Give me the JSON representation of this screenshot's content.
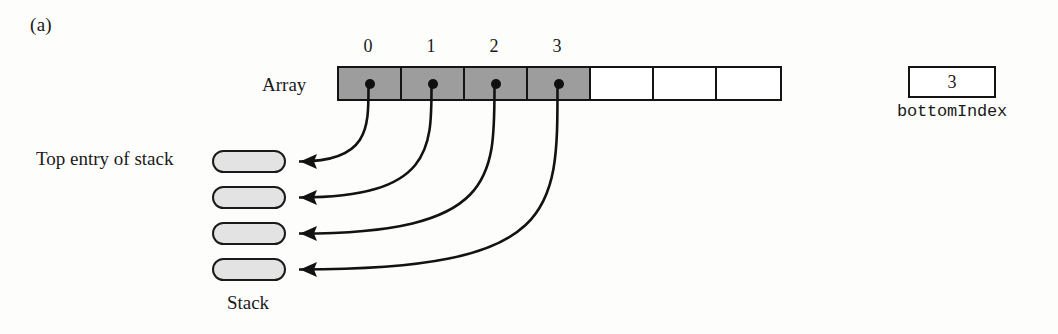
{
  "figure": {
    "panel_label": "(a)"
  },
  "array": {
    "label": "Array",
    "cell_count": 7,
    "filled_count": 4,
    "index_labels": [
      "0",
      "1",
      "2",
      "3"
    ],
    "indices_x": [
      368,
      431,
      494,
      557
    ],
    "geometry": {
      "left": 337,
      "top": 66,
      "cell_width": 63,
      "height": 35
    },
    "fill_color": "#9d9d9d",
    "border_color": "#141414",
    "dot_color": "#101010"
  },
  "bottom_index": {
    "value": "3",
    "label": "bottomIndex"
  },
  "stack": {
    "label": "Stack",
    "top_entry_label": "Top entry of stack",
    "cell_count": 4,
    "cells_top": [
      150,
      186,
      222,
      258
    ],
    "fill_color": "#e3e3e3",
    "border_color": "#1a1a1a"
  },
  "arrows": {
    "count": 4,
    "color": "#121212",
    "description": "curved pointers from each filled array cell dot to a stack entry",
    "paths": [
      "M 368.5,88 C 368.5,128 368.5,161.5 300,161.5 L 299,161.5",
      "M 431.5,88 C 431.5,148 431.5,197.5 300,197.5 L 299,197.5",
      "M 494.5,88 C 494.5,178 494.5,233.5 300,233.5 L 299,233.5",
      "M 557.5,88 C 557.5,212 557.5,269.5 300,269.5 L 299,269.5"
    ],
    "heads": [
      "300,161.5 317,154 314,161.5 317,169",
      "300,197.5 317,190 314,197.5 317,205",
      "300,233.5 317,226 314,233.5 317,241",
      "300,269.5 317,262 314,269.5 317,277"
    ]
  }
}
